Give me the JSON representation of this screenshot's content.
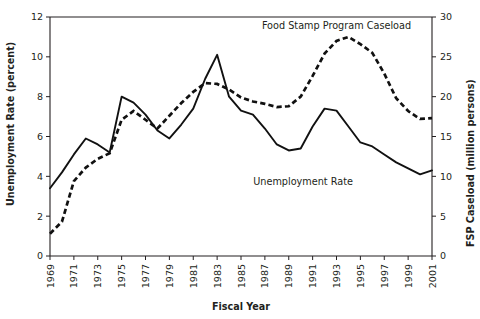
{
  "chart_data": {
    "type": "line",
    "title": "",
    "xlabel": "Fiscal Year",
    "ylabel": "Unemployment Rate (percent)",
    "y2label": "FSP Caseload (million persons)",
    "grid": false,
    "legend_position": "inline-annotations",
    "xlim": [
      1969,
      2001
    ],
    "ylim": [
      0,
      12
    ],
    "y2lim": [
      0,
      30
    ],
    "x_tick_labels": [
      "1969",
      "1971",
      "1973",
      "1975",
      "1977",
      "1979",
      "1981",
      "1983",
      "1985",
      "1987",
      "1989",
      "1991",
      "1993",
      "1995",
      "1997",
      "1999",
      "2001"
    ],
    "x_ticks_all": [
      1969,
      1970,
      1971,
      1972,
      1973,
      1974,
      1975,
      1976,
      1977,
      1978,
      1979,
      1980,
      1981,
      1982,
      1983,
      1984,
      1985,
      1986,
      1987,
      1988,
      1989,
      1990,
      1991,
      1992,
      1993,
      1994,
      1995,
      1996,
      1997,
      1998,
      1999,
      2000,
      2001
    ],
    "y_tick_labels": [
      "0",
      "2",
      "4",
      "6",
      "8",
      "10",
      "12"
    ],
    "y_ticks": [
      0,
      2,
      4,
      6,
      8,
      10,
      12
    ],
    "y2_tick_labels": [
      "0",
      "5",
      "10",
      "15",
      "20",
      "25",
      "30"
    ],
    "y2_ticks": [
      0,
      5,
      10,
      15,
      20,
      25,
      30
    ],
    "x": [
      1969,
      1970,
      1971,
      1972,
      1973,
      1974,
      1975,
      1976,
      1977,
      1978,
      1979,
      1980,
      1981,
      1982,
      1983,
      1984,
      1985,
      1986,
      1987,
      1988,
      1989,
      1990,
      1991,
      1992,
      1993,
      1994,
      1995,
      1996,
      1997,
      1998,
      1999,
      2000,
      2001
    ],
    "series": [
      {
        "name": "Unemployment Rate",
        "style": "solid",
        "axis": "left",
        "units": "percent",
        "label_text": "Unemployment Rate",
        "values": [
          3.4,
          4.2,
          5.1,
          5.9,
          5.6,
          5.2,
          8.0,
          7.7,
          7.1,
          6.3,
          5.9,
          6.6,
          7.4,
          8.9,
          10.1,
          8.0,
          7.3,
          7.1,
          6.4,
          5.6,
          5.3,
          5.4,
          6.5,
          7.4,
          7.3,
          6.5,
          5.7,
          5.5,
          5.1,
          4.7,
          4.4,
          4.1,
          4.3
        ]
      },
      {
        "name": "Food Stamp Program Caseload",
        "style": "dashed",
        "axis": "right",
        "units": "million persons",
        "label_text": "Food Stamp Program Caseload",
        "values": [
          2.8,
          4.3,
          9.4,
          11.1,
          12.2,
          12.9,
          17.1,
          18.2,
          17.1,
          16.0,
          17.6,
          19.2,
          20.6,
          21.7,
          21.6,
          20.9,
          19.9,
          19.4,
          19.1,
          18.7,
          18.8,
          20.0,
          22.6,
          25.4,
          27.0,
          27.5,
          26.6,
          25.5,
          22.9,
          19.8,
          18.2,
          17.2,
          17.3
        ]
      }
    ],
    "annotations": [
      {
        "text": "Food Stamp Program Caseload",
        "x": 1993.0,
        "y": 11.4,
        "anchor": "middle"
      },
      {
        "text": "Unemployment Rate",
        "x": 1990.2,
        "y": 3.55,
        "anchor": "middle"
      }
    ]
  }
}
